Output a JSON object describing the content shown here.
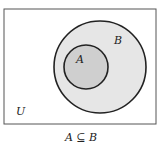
{
  "diagram": {
    "type": "venn",
    "universe_label": "U",
    "sets": [
      {
        "name": "B",
        "label": "B",
        "fill": "#e6e6e6",
        "contains": [
          "A"
        ]
      },
      {
        "name": "A",
        "label": "A",
        "fill": "#cfcfcf"
      }
    ],
    "caption": "A ⊆ B",
    "colors": {
      "stroke": "#222222",
      "background": "#ffffff"
    }
  }
}
